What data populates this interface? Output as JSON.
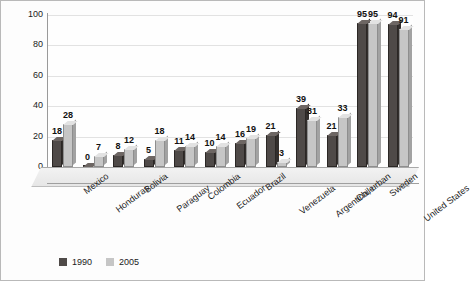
{
  "chart_data": {
    "type": "bar",
    "title": "",
    "xlabel": "",
    "ylabel": "",
    "ylim": [
      0,
      100
    ],
    "yticks": [
      100,
      80,
      60,
      40,
      20,
      0
    ],
    "grid": true,
    "legend_position": "bottom-left",
    "categories": [
      "Mexico",
      "Honduras",
      "Bolivia",
      "Paraguay",
      "Colombia",
      "Ecuador",
      "Brazil",
      "Venezuela",
      "Argentina, urban",
      "Chile",
      "Sweden",
      "United States"
    ],
    "series": [
      {
        "name": "1990",
        "color": "#4f4a48",
        "values": [
          18,
          0,
          8,
          5,
          11,
          10,
          16,
          21,
          39,
          21,
          95,
          94
        ]
      },
      {
        "name": "2005",
        "color": "#c6c6c6",
        "values": [
          28,
          7,
          12,
          18,
          14,
          14,
          19,
          3,
          31,
          33,
          95,
          91
        ]
      }
    ]
  }
}
